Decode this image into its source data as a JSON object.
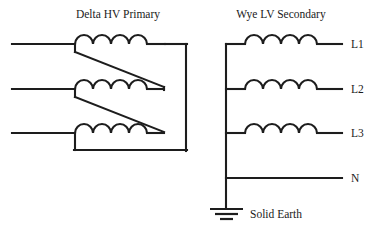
{
  "diagram": {
    "kind": "delta-wye-transformer-schematic",
    "background_color": "#ffffff",
    "line_color": "#1d1d1d",
    "titles": {
      "primary": "Delta HV Primary",
      "secondary": "Wye LV Secondary"
    },
    "terminals": [
      {
        "id": "l1",
        "label": "L1"
      },
      {
        "id": "l2",
        "label": "L2"
      },
      {
        "id": "l3",
        "label": "L3"
      },
      {
        "id": "n",
        "label": "N"
      }
    ],
    "earth": {
      "label": "Solid Earth",
      "symbol": "ground-symbol",
      "bars": 3
    },
    "primary_windings": [
      {
        "id": "primary-coil-1",
        "bumps": 4
      },
      {
        "id": "primary-coil-2",
        "bumps": 4
      },
      {
        "id": "primary-coil-3",
        "bumps": 4
      }
    ],
    "secondary_windings": [
      {
        "id": "secondary-coil-l1",
        "bumps": 4
      },
      {
        "id": "secondary-coil-l2",
        "bumps": 4
      },
      {
        "id": "secondary-coil-l3",
        "bumps": 4
      }
    ]
  }
}
